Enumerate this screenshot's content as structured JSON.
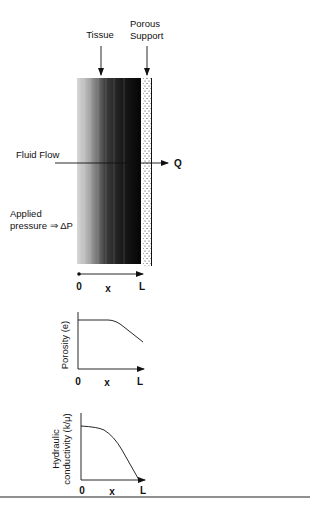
{
  "top_fragment": "",
  "diagram": {
    "labels": {
      "tissue": "Tissue",
      "porous_line1": "Porous",
      "porous_line2": "Support",
      "fluid_flow": "Fluid Flow",
      "flow_out": "Q",
      "pressure_line1": "Applied",
      "pressure_line2": "pressure ⇒ ΔP"
    },
    "axis": {
      "start": "0",
      "mid": "x",
      "end": "L"
    }
  },
  "plots": [
    {
      "ylabel": "Porosity (e)",
      "xticks": [
        "0",
        "x",
        "L"
      ]
    },
    {
      "ylabel_line1": "Hydraulic",
      "ylabel_line2": "conductivity (k/μ)",
      "xticks": [
        "0",
        "x",
        "L"
      ]
    }
  ],
  "colors": {
    "ink": "#111111",
    "background": "#ffffff"
  }
}
